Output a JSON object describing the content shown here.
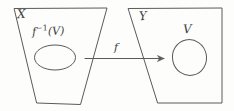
{
  "figure": {
    "caption_type": "math-diagram",
    "background_color": "#fdfdfc",
    "ink_color": "#5a5a5a",
    "text_color": "#3c3c3c"
  },
  "domain_region": {
    "label": "X",
    "subset_label_base": "f",
    "subset_label_exponent": "−1",
    "subset_label_arg": "(V)",
    "subset_label_full": "f⁻¹(V)"
  },
  "codomain_region": {
    "label": "Y",
    "subset_label": "V"
  },
  "mapping": {
    "label": "f",
    "arrow_from": "X",
    "arrow_to": "Y",
    "arrow_direction": "right"
  }
}
